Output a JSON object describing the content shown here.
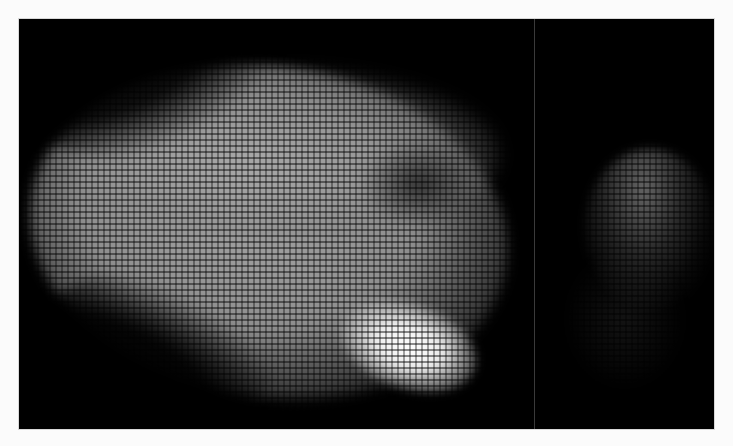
{
  "figure": {
    "description": "Two-panel grayscale imaging figure with a pixelated/fiber-bundle grid texture",
    "panels": [
      {
        "id": "left",
        "content": "Large bright elongated region with a very bright spot at lower-right and a darker patch at upper-right"
      },
      {
        "id": "right",
        "content": "Faint dim region in upper-middle area"
      }
    ],
    "colors": {
      "background": "#fbfbfb",
      "frame": "#000000",
      "divider": "#3a3a3a"
    }
  }
}
